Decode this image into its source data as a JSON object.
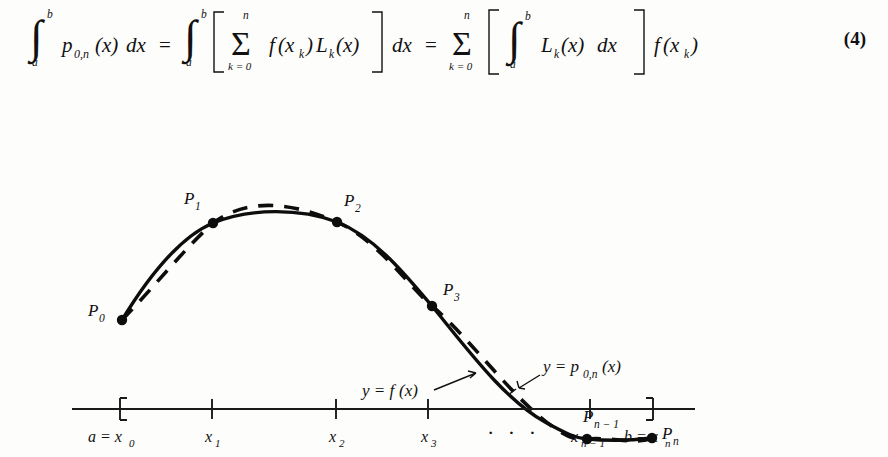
{
  "equation": {
    "number": "(4)",
    "latex_reading": "∫_a^b p_{0,n}(x) dx = ∫_a^b [ Σ_{k=0}^{n} f(x_k) L_k(x) ] dx = Σ_{k=0}^{n} [ ∫_a^b L_k(x) dx ] f(x_k)",
    "parts": {
      "int1_lower": "a",
      "int1_upper": "b",
      "integrand1": "p",
      "integrand1_sub": "0,n",
      "integrand1_arg": "(x)",
      "differential1": "dx",
      "equals1": "=",
      "int2_lower": "a",
      "int2_upper": "b",
      "bracket_open1": "[",
      "sum1_symbol": "Σ",
      "sum1_lower": "k = 0",
      "sum1_upper": "n",
      "sum1_body_f": "f",
      "sum1_body_fx": "(x",
      "sum1_body_fsub": "k",
      "sum1_body_fclose": ")",
      "sum1_body_L": "L",
      "sum1_body_Lsub": "k",
      "sum1_body_Lx": "(x)",
      "bracket_close1": "]",
      "differential2": "dx",
      "equals2": "=",
      "sum2_symbol": "Σ",
      "sum2_lower": "k = 0",
      "sum2_upper": "n",
      "bracket_open2": "[",
      "int3_lower": "a",
      "int3_upper": "b",
      "int3_body_L": "L",
      "int3_body_Lsub": "k",
      "int3_body_Lx": "(x)",
      "differential3": "dx",
      "bracket_close2": "]",
      "tail_f": "f",
      "tail_open": "(x",
      "tail_sub": "k",
      "tail_close": ")"
    }
  },
  "figure": {
    "curve_labels": [
      {
        "name": "p-curve-label",
        "base": "y = p",
        "sub": "0,n",
        "tail": "(x)"
      },
      {
        "name": "f-curve-label",
        "base": "y = f",
        "sub": "",
        "tail": "(x)"
      }
    ],
    "points": [
      {
        "id": "P0",
        "base": "P",
        "sub": "0",
        "x": 122,
        "y": 238,
        "label_x": 95,
        "label_y": 234
      },
      {
        "id": "P1",
        "base": "P",
        "sub": "1",
        "x": 213,
        "y": 141,
        "label_x": 186,
        "label_y": 123
      },
      {
        "id": "P2",
        "base": "P",
        "sub": "2",
        "x": 337,
        "y": 140,
        "label_x": 344,
        "label_y": 126
      },
      {
        "id": "P3",
        "base": "P",
        "sub": "3",
        "x": 432,
        "y": 224,
        "label_x": 442,
        "label_y": 213
      },
      {
        "id": "Pn1",
        "base": "P",
        "sub": "n − 1",
        "x": 587,
        "y": 357,
        "label_x": 588,
        "label_y": 342
      },
      {
        "id": "Pn",
        "base": "P",
        "sub": "n",
        "x": 652,
        "y": 356,
        "label_x": 661,
        "label_y": 358
      }
    ],
    "annotation_p": {
      "text_main": "y = p",
      "text_sub": "0,n",
      "text_tail": "(x)",
      "x": 543,
      "y": 290
    },
    "annotation_f": {
      "text_main": "y = f",
      "text_tail": "(x)",
      "x": 362,
      "y": 314
    }
  },
  "axis": {
    "ticks": [
      {
        "label_main": "a = x",
        "label_sub": "0",
        "x": 120,
        "bracket": "left"
      },
      {
        "label_main": "x",
        "label_sub": "1",
        "x": 212,
        "bracket": "none"
      },
      {
        "label_main": "x",
        "label_sub": "2",
        "x": 336,
        "bracket": "none"
      },
      {
        "label_main": "x",
        "label_sub": "3",
        "x": 428,
        "bracket": "none"
      },
      {
        "label_main": "x",
        "label_sub": "n − 1",
        "x": 590,
        "bracket": "none"
      },
      {
        "label_main": "b = x",
        "label_sub": "n",
        "x": 653,
        "bracket": "right"
      }
    ],
    "ellipsis": "·  ·  ·",
    "ellipsis_x": 510,
    "line_start": 72,
    "line_end": 695
  },
  "colors": {
    "ink": "#0d0d0d",
    "page": "#fdfdfc",
    "axis": "#1a1a1a"
  }
}
